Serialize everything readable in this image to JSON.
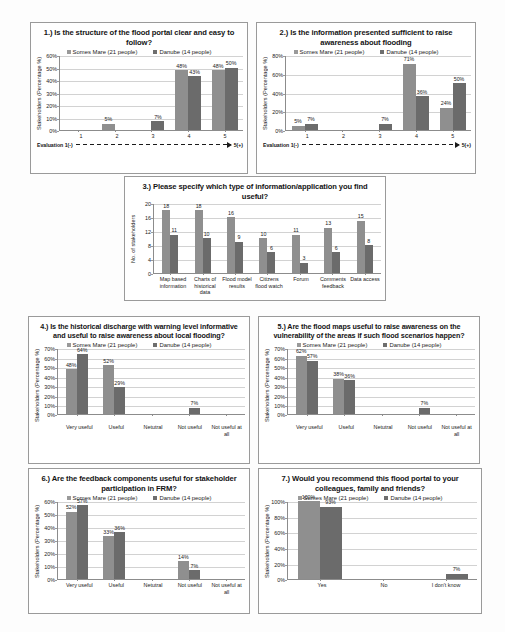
{
  "legend": {
    "series_a": "Somes Mare (21 people)",
    "series_b": "Danube (14 people)"
  },
  "axis": {
    "y_percent_label": "Stakeholders (Percentage %)",
    "y_count_label": "No. of stakeholders",
    "eval_left": "Evaluation 1(-)",
    "eval_right": "5(+)"
  },
  "chart_data": [
    {
      "id": "q1",
      "type": "bar",
      "title": "1.) Is the structure of the flood portal clear and easy to follow?",
      "xlabel": "",
      "ylabel": "Stakeholders (Percentage %)",
      "categories": [
        "1",
        "2",
        "3",
        "4",
        "5"
      ],
      "ylim": [
        0,
        60
      ],
      "yticks": [
        "0%",
        "10%",
        "20%",
        "30%",
        "40%",
        "50%",
        "60%"
      ],
      "grid": true,
      "legend_position": "top",
      "series": [
        {
          "name": "Somes Mare (21 people)",
          "values": [
            0,
            5,
            0,
            48,
            48
          ],
          "labels": [
            "",
            "5%",
            "",
            "48%",
            "48%"
          ]
        },
        {
          "name": "Danube (14 people)",
          "values": [
            0,
            0,
            7,
            43,
            50
          ],
          "labels": [
            "",
            "",
            "7%",
            "43%",
            "50%"
          ]
        }
      ]
    },
    {
      "id": "q2",
      "type": "bar",
      "title": "2.) Is the information presented sufficient to raise awareness about flooding",
      "xlabel": "",
      "ylabel": "Stakeholders (Percentage %)",
      "categories": [
        "1",
        "2",
        "3",
        "4",
        "5"
      ],
      "ylim": [
        0,
        80
      ],
      "yticks": [
        "0%",
        "20%",
        "40%",
        "60%",
        "80%"
      ],
      "grid": true,
      "legend_position": "top",
      "series": [
        {
          "name": "Somes Mare (21 people)",
          "values": [
            5,
            0,
            0,
            71,
            24
          ],
          "labels": [
            "5%",
            "",
            "",
            "71%",
            "24%"
          ]
        },
        {
          "name": "Danube (14 people)",
          "values": [
            7,
            0,
            7,
            36,
            50
          ],
          "labels": [
            "7%",
            "",
            "7%",
            "36%",
            "50%"
          ]
        }
      ]
    },
    {
      "id": "q3",
      "type": "bar",
      "title": "3.) Please specify which type of information/application you find useful?",
      "xlabel": "",
      "ylabel": "No. of stakeholders",
      "categories": [
        "Map based information",
        "Charts of historical data",
        "Flood model results",
        "Citizens flood watch",
        "Forum",
        "Comments feedback",
        "Data access"
      ],
      "ylim": [
        0,
        20
      ],
      "yticks": [
        "0",
        "4",
        "8",
        "12",
        "16",
        "20"
      ],
      "grid": true,
      "legend_position": "none",
      "series": [
        {
          "name": "Somes Mare (21 people)",
          "values": [
            18,
            18,
            16,
            10,
            11,
            13,
            15
          ],
          "labels": [
            "18",
            "18",
            "16",
            "10",
            "11",
            "13",
            "15"
          ]
        },
        {
          "name": "Danube (14 people)",
          "values": [
            11,
            10,
            9,
            6,
            3,
            6,
            8
          ],
          "labels": [
            "11",
            "10",
            "9",
            "6",
            "3",
            "6",
            "8"
          ]
        }
      ]
    },
    {
      "id": "q4",
      "type": "bar",
      "title": "4.) Is the historical discharge with warning level informative and useful to raise awareness about local flooding?",
      "xlabel": "",
      "ylabel": "Stakeholders (Percentage %)",
      "categories": [
        "Very useful",
        "Useful",
        "Netutral",
        "Not useful",
        "Not useful at all"
      ],
      "ylim": [
        0,
        70
      ],
      "yticks": [
        "0%",
        "10%",
        "20%",
        "30%",
        "40%",
        "50%",
        "60%",
        "70%"
      ],
      "grid": true,
      "legend_position": "top",
      "series": [
        {
          "name": "Somes Mare (21 people)",
          "values": [
            48,
            52,
            0,
            0,
            0
          ],
          "labels": [
            "48%",
            "52%",
            "",
            "",
            ""
          ]
        },
        {
          "name": "Danube (14 people)",
          "values": [
            64,
            29,
            0,
            7,
            0
          ],
          "labels": [
            "64%",
            "29%",
            "",
            "7%",
            ""
          ]
        }
      ]
    },
    {
      "id": "q5",
      "type": "bar",
      "title": "5.) Are the flood maps useful to raise awareness on the vulnerability of the areas if such flood scenarios happen?",
      "xlabel": "",
      "ylabel": "Stakeholders (Percentage %)",
      "categories": [
        "Very useful",
        "Useful",
        "Netutral",
        "Not useful",
        "Not useful at all"
      ],
      "ylim": [
        0,
        70
      ],
      "yticks": [
        "0%",
        "10%",
        "20%",
        "30%",
        "40%",
        "50%",
        "60%",
        "70%"
      ],
      "grid": true,
      "legend_position": "top",
      "series": [
        {
          "name": "Somes Mare (21 people)",
          "values": [
            62,
            38,
            0,
            0,
            0
          ],
          "labels": [
            "62%",
            "38%",
            "",
            "",
            ""
          ]
        },
        {
          "name": "Danube (14 people)",
          "values": [
            57,
            36,
            0,
            7,
            0
          ],
          "labels": [
            "57%",
            "36%",
            "",
            "7%",
            ""
          ]
        }
      ]
    },
    {
      "id": "q6",
      "type": "bar",
      "title": "6.) Are the feedback components useful  for stakeholder participation in FRM?",
      "xlabel": "",
      "ylabel": "Stakeholders (Percentage %)",
      "categories": [
        "Very useful",
        "Useful",
        "Netutral",
        "Not useful",
        "Not useful at all"
      ],
      "ylim": [
        0,
        60
      ],
      "yticks": [
        "0%",
        "10%",
        "20%",
        "30%",
        "40%",
        "50%",
        "60%"
      ],
      "grid": true,
      "legend_position": "top",
      "series": [
        {
          "name": "Somes Mare (21 people)",
          "values": [
            52,
            33,
            0,
            14,
            0
          ],
          "labels": [
            "52%",
            "33%",
            "",
            "14%",
            ""
          ]
        },
        {
          "name": "Danube (14 people)",
          "values": [
            57,
            36,
            0,
            7,
            0
          ],
          "labels": [
            "57%",
            "36%",
            "",
            "7%",
            ""
          ]
        }
      ]
    },
    {
      "id": "q7",
      "type": "bar",
      "title": "7.) Would you recommend this flood portal to your colleagues, family and friends?",
      "xlabel": "",
      "ylabel": "Stakeholders (Percentage %)",
      "categories": [
        "Yes",
        "No",
        "I don't know"
      ],
      "ylim": [
        0,
        100
      ],
      "yticks": [
        "0%",
        "20%",
        "40%",
        "60%",
        "80%",
        "100%"
      ],
      "grid": true,
      "legend_position": "top",
      "series": [
        {
          "name": "Somes Mare (21 people)",
          "values": [
            100,
            0,
            0
          ],
          "labels": [
            "100%",
            "",
            ""
          ]
        },
        {
          "name": "Danube (14 people)",
          "values": [
            93,
            0,
            7
          ],
          "labels": [
            "93%",
            "",
            "7%"
          ]
        }
      ]
    }
  ]
}
